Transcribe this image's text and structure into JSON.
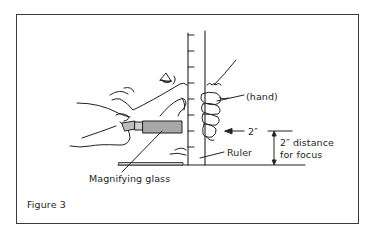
{
  "figure": {
    "caption": "Figure 3",
    "labels": {
      "hand": "(hand)",
      "two_inch": "2″",
      "distance_line1": "2″ distance",
      "distance_line2": "for focus",
      "ruler": "Ruler",
      "magnifying_glass": "Magnifying glass"
    },
    "elements": [
      "ruler",
      "hand-gripping-ruler",
      "hands-holding-magnifying-glass",
      "eye",
      "magnifying-glass",
      "table-baseline",
      "dimension-line"
    ],
    "colors": {
      "line": "#222222",
      "glass_fill": "#a8a8a8",
      "background": "#ffffff"
    }
  }
}
